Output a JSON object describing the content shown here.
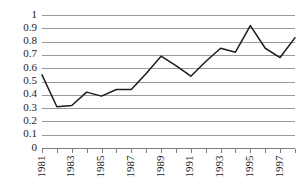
{
  "chart_data": {
    "type": "line",
    "title": "",
    "xlabel": "",
    "ylabel": "",
    "grid": true,
    "legend": "none",
    "ylim": [
      0,
      1
    ],
    "ytick_labels": [
      "1",
      "0.9",
      "0.8",
      "0.7",
      "0.6",
      "0.5",
      "0.4",
      "0.3",
      "0.2",
      "0.1",
      "0"
    ],
    "ytick_values": [
      1,
      0.9,
      0.8,
      0.7,
      0.6,
      0.5,
      0.4,
      0.3,
      0.2,
      0.1,
      0
    ],
    "x": [
      1981,
      1982,
      1983,
      1984,
      1985,
      1986,
      1987,
      1988,
      1989,
      1990,
      1991,
      1992,
      1993,
      1994,
      1995,
      1996,
      1997,
      1998
    ],
    "xtick_labels": [
      "1981",
      "",
      "1983",
      "",
      "1985",
      "",
      "1987",
      "",
      "1989",
      "",
      "1991",
      "",
      "1993",
      "",
      "1995",
      "",
      "1997",
      ""
    ],
    "xlim": [
      1981,
      1998
    ],
    "series": [
      {
        "name": "series-1",
        "color": "#1c1c1c",
        "values": [
          0.55,
          0.31,
          0.32,
          0.42,
          0.39,
          0.44,
          0.44,
          0.56,
          0.69,
          0.62,
          0.54,
          0.65,
          0.75,
          0.72,
          0.92,
          0.75,
          0.68,
          0.83
        ]
      }
    ],
    "colors": {
      "line": "#1c1c1c",
      "grid": "#9a9a9a",
      "axis": "#7d7d7d",
      "text": "#1a1a1a",
      "background": "#ffffff"
    }
  }
}
